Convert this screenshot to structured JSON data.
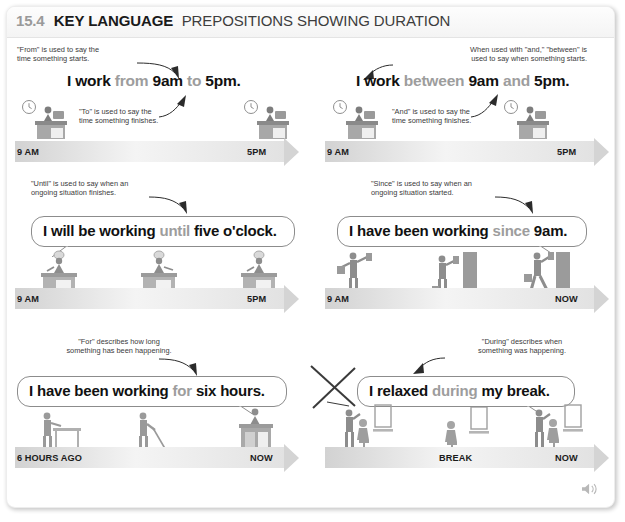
{
  "header": {
    "number": "15.4",
    "key_label": "KEY LANGUAGE",
    "title": "PREPOSITIONS SHOWING DURATION"
  },
  "colors": {
    "accent_gray": "#9d9d9d",
    "text": "#231f20",
    "timeline": "#d2d2d2",
    "bubble_border": "#8c8c8c"
  },
  "examples": [
    {
      "id": "from-to",
      "note_top": "\"From\" is used to say the\ntime something starts.",
      "note_bottom": "\"To\" is used to say the\ntime something finishes.",
      "sentence": [
        {
          "text": "I work ",
          "style": "bold"
        },
        {
          "text": "from",
          "style": "gray"
        },
        {
          "text": " 9am ",
          "style": "bold"
        },
        {
          "text": "to",
          "style": "gray"
        },
        {
          "text": " 5pm.",
          "style": "bold"
        }
      ],
      "timeline": {
        "start": "9 AM",
        "end": "5PM"
      },
      "figures": [
        "clock-desk-worker",
        "clock-desk-worker"
      ]
    },
    {
      "id": "between-and",
      "note_top": "When used with \"and,\" \"between\" is\nused to say when something starts.",
      "note_bottom": "\"And\" is used to say the\ntime something finishes.",
      "sentence": [
        {
          "text": "I work ",
          "style": "bold"
        },
        {
          "text": "between",
          "style": "gray"
        },
        {
          "text": " 9am ",
          "style": "bold"
        },
        {
          "text": "and",
          "style": "gray"
        },
        {
          "text": " 5pm.",
          "style": "bold"
        }
      ],
      "timeline": {
        "start": "9 AM",
        "end": "5PM"
      },
      "figures": [
        "clock-desk-worker",
        "clock-desk-worker"
      ]
    },
    {
      "id": "until",
      "note_top": "\"Until\" is used to say when an\nongoing situation finishes.",
      "sentence": [
        {
          "text": "I will be working ",
          "style": "bold"
        },
        {
          "text": "until",
          "style": "gray"
        },
        {
          "text": " five o'clock.",
          "style": "bold"
        }
      ],
      "timeline": {
        "start": "9 AM",
        "end": "5PM"
      },
      "figures": [
        "chef-cooking",
        "chef-cooking",
        "chef-cooking"
      ]
    },
    {
      "id": "since",
      "note_top": "\"Since\" is used to say when an\nongoing situation started.",
      "sentence": [
        {
          "text": "I have been working ",
          "style": "bold"
        },
        {
          "text": "since",
          "style": "gray"
        },
        {
          "text": " 9am.",
          "style": "bold"
        }
      ],
      "timeline": {
        "start": "9 AM",
        "end": "NOW"
      },
      "figures": [
        "painter",
        "painter",
        "painter"
      ]
    },
    {
      "id": "for",
      "note_top": "\"For\" describes how long\nsomething has been happening.",
      "sentence": [
        {
          "text": "I have been working ",
          "style": "bold"
        },
        {
          "text": "for",
          "style": "gray"
        },
        {
          "text": " six hours.",
          "style": "bold"
        }
      ],
      "timeline": {
        "start": "6 HOURS AGO",
        "end": "NOW"
      },
      "figures": [
        "worker-table",
        "worker-mop",
        "worker-desk"
      ]
    },
    {
      "id": "during",
      "note_top": "\"During\" describes when\nsomething was happening.",
      "sentence": [
        {
          "text": "I relaxed ",
          "style": "bold"
        },
        {
          "text": "during",
          "style": "gray"
        },
        {
          "text": " my break.",
          "style": "bold"
        }
      ],
      "timeline": {
        "start": "",
        "mid": "BREAK",
        "end": "NOW"
      },
      "figures": [
        "hairdresser",
        "hairdresser-seated",
        "hairdresser"
      ]
    }
  ],
  "audio_icon": "speaker-icon"
}
